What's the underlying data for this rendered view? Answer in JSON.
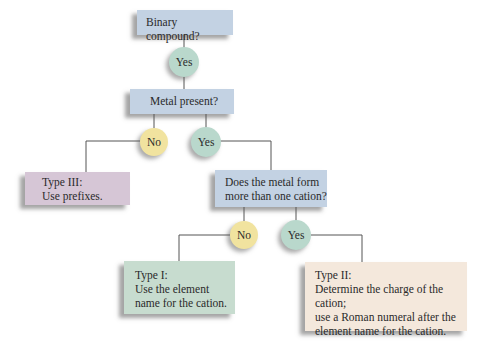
{
  "diagram": {
    "type": "flowchart",
    "colors": {
      "question_box": "#c3d2e3",
      "yes_circle": "#b9d8cc",
      "no_circle": "#f1e39f",
      "type_iii_box": "#d6c6d6",
      "type_i_box": "#c7dccf",
      "type_ii_box": "#f4e8dc",
      "connector": "#555555"
    },
    "nodes": {
      "q1": {
        "text": "Binary compound?"
      },
      "q1_yes": {
        "text": "Yes"
      },
      "q2": {
        "text": "Metal present?"
      },
      "q2_no": {
        "text": "No"
      },
      "q2_yes": {
        "text": "Yes"
      },
      "type3": {
        "line1": "Type III:",
        "line2": "Use prefixes."
      },
      "q3": {
        "line1": "Does the metal form",
        "line2": "more than one cation?"
      },
      "q3_no": {
        "text": "No"
      },
      "q3_yes": {
        "text": "Yes"
      },
      "type1": {
        "line1": "Type I:",
        "line2": "Use the element",
        "line3": "name for the cation."
      },
      "type2": {
        "line1": "Type II:",
        "line2": "Determine the charge of the cation;",
        "line3": "use a Roman numeral after the",
        "line4": "element name for the cation."
      }
    },
    "edges": [
      [
        "q1",
        "q1_yes"
      ],
      [
        "q1_yes",
        "q2"
      ],
      [
        "q2",
        "q2_no"
      ],
      [
        "q2",
        "q2_yes"
      ],
      [
        "q2_no",
        "type3"
      ],
      [
        "q2_yes",
        "q3"
      ],
      [
        "q3",
        "q3_no"
      ],
      [
        "q3",
        "q3_yes"
      ],
      [
        "q3_no",
        "type1"
      ],
      [
        "q3_yes",
        "type2"
      ]
    ]
  }
}
